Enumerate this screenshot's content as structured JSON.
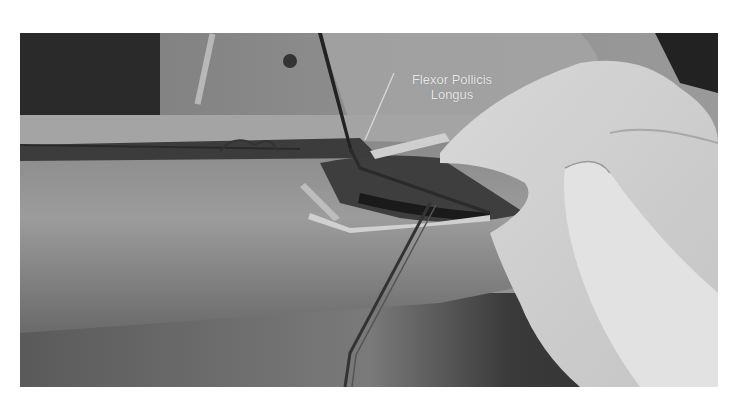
{
  "figure": {
    "type": "photograph",
    "tone": "grayscale",
    "annotation": {
      "line1": "Flexor Pollicis",
      "line2": "Longus"
    },
    "colors": {
      "background": "#ffffff",
      "label_text": "#e8e8e8"
    }
  }
}
